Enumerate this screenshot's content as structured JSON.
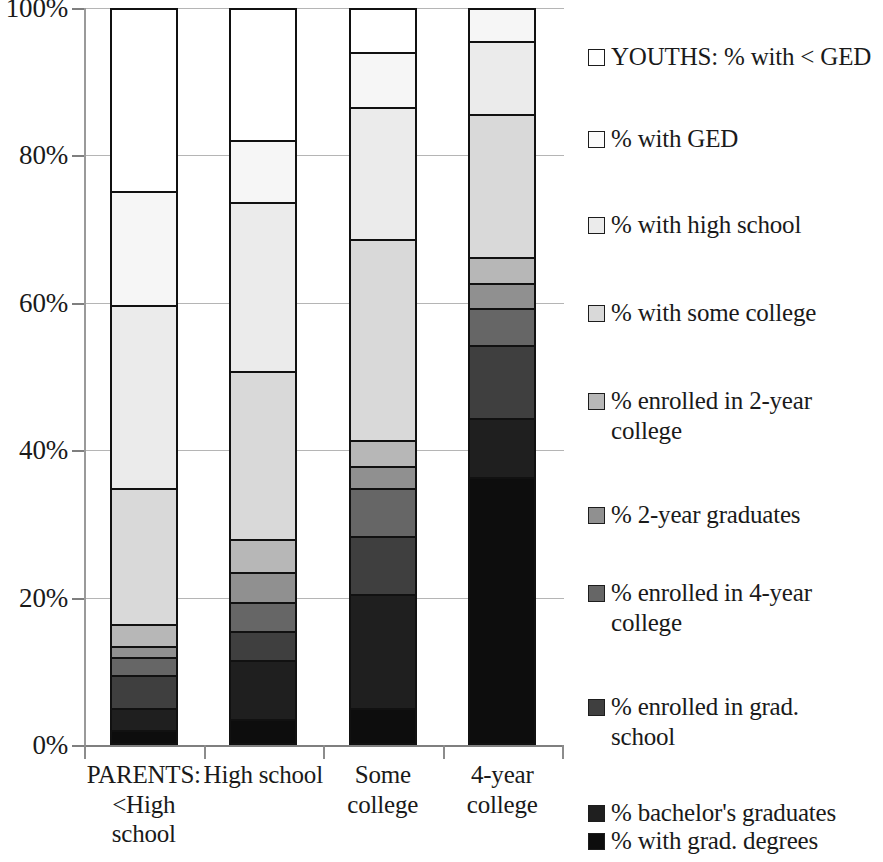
{
  "chart_data": {
    "type": "bar",
    "subtype": "stacked-bar-100-percent",
    "title": "",
    "xlabel": "",
    "ylabel": "",
    "ylim": [
      0,
      100
    ],
    "ytick_labels": [
      "0%",
      "20%",
      "40%",
      "60%",
      "80%",
      "100%"
    ],
    "ytick_values": [
      0,
      20,
      40,
      60,
      80,
      100
    ],
    "grid": true,
    "legend_position": "right",
    "stack_order_bottom_to_top": [
      "% with grad. degrees",
      "% bachelor's graduates",
      "% enrolled in grad. school",
      "% enrolled in 4-year college",
      "% 2-year graduates",
      "% enrolled in 2-year college",
      "% with some college",
      "% with high school",
      "% with GED",
      "YOUTHS:  % with < GED"
    ],
    "categories": [
      "PARENTS:\n<High\nschool",
      "High\nschool",
      "Some\ncollege",
      "4-year\ncollege"
    ],
    "series": [
      {
        "name": "% with grad. degrees",
        "color": "#0d0d0d",
        "values": [
          1.5,
          3.0,
          4.5,
          36.0
        ]
      },
      {
        "name": "% bachelor's graduates",
        "color": "#1f1f1f",
        "values": [
          3.0,
          8.0,
          15.5,
          8.0
        ]
      },
      {
        "name": "% enrolled in grad. school",
        "color": "#3f3f3f",
        "values": [
          4.5,
          4.0,
          8.0,
          10.0
        ]
      },
      {
        "name": "% enrolled in 4-year college",
        "color": "#666666",
        "values": [
          2.5,
          4.0,
          6.5,
          5.0
        ]
      },
      {
        "name": "% 2-year graduates",
        "color": "#909090",
        "values": [
          1.5,
          4.0,
          3.0,
          3.5
        ]
      },
      {
        "name": "% enrolled in 2-year college",
        "color": "#b7b7b7",
        "values": [
          3.0,
          4.5,
          3.5,
          3.5
        ]
      },
      {
        "name": "% with some college",
        "color": "#d9d9d9",
        "values": [
          18.5,
          23.0,
          27.5,
          19.5
        ]
      },
      {
        "name": "% with high school",
        "color": "#ebebeb",
        "values": [
          25.0,
          23.0,
          18.0,
          10.0
        ]
      },
      {
        "name": "% with GED",
        "color": "#f6f6f6",
        "values": [
          15.5,
          8.5,
          7.5,
          4.5
        ]
      },
      {
        "name": "YOUTHS:  % with < GED",
        "color": "#ffffff",
        "values": [
          25.0,
          18.0,
          6.0,
          0.0
        ]
      }
    ]
  },
  "axis": {
    "yticks": [
      {
        "label": "100%",
        "value": 100
      },
      {
        "label": "80%",
        "value": 80
      },
      {
        "label": "60%",
        "value": 60
      },
      {
        "label": "40%",
        "value": 40
      },
      {
        "label": "20%",
        "value": 20
      },
      {
        "label": "0%",
        "value": 0
      }
    ]
  },
  "xlabels": [
    "PARENTS:\n<High\nschool",
    "High\nschool",
    "Some\ncollege",
    "4-year\ncollege"
  ],
  "legend": {
    "items": [
      {
        "label": "YOUTHS:  % with < GED",
        "color": "#ffffff"
      },
      {
        "label": "% with GED",
        "color": "#fbfbfb"
      },
      {
        "label": "% with high school",
        "color": "#ebebeb"
      },
      {
        "label": "% with some college",
        "color": "#d9d9d9"
      },
      {
        "label": "% enrolled in 2-year\ncollege",
        "color": "#b7b7b7"
      },
      {
        "label": "% 2-year graduates",
        "color": "#909090"
      },
      {
        "label": "% enrolled in 4-year\ncollege",
        "color": "#666666"
      },
      {
        "label": "% enrolled in grad.\nschool",
        "color": "#3f3f3f"
      },
      {
        "label": "% bachelor's graduates",
        "color": "#1f1f1f"
      },
      {
        "label": "% with grad. degrees",
        "color": "#0d0d0d"
      }
    ],
    "item_tops": [
      22,
      104,
      190,
      278,
      366,
      480,
      558,
      672,
      778,
      806
    ]
  }
}
